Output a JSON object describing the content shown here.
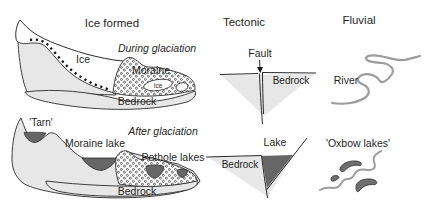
{
  "ice_formed": {
    "title": "Ice formed",
    "during": {
      "caption": "During glaciation",
      "ice": "Ice",
      "moraine": "Moraine",
      "bedrock": "Bedrock",
      "buried_ice": "Ice"
    },
    "after": {
      "caption": "After glaciation",
      "tarn": "'Tarn'",
      "moraine_lake": "Moraine lake",
      "pothole_lakes": "Pothole lakes",
      "bedrock": "Bedrock"
    }
  },
  "tectonic": {
    "title": "Tectonic",
    "during": {
      "fault": "Fault",
      "bedrock": "Bedrock"
    },
    "after": {
      "lake": "Lake",
      "bedrock": "Bedrock"
    }
  },
  "fluvial": {
    "title": "Fluvial",
    "during": {
      "river": "River"
    },
    "after": {
      "oxbow_lakes": "'Oxbow lakes'"
    }
  },
  "colors": {
    "land_gray": "#e7e7e7",
    "water_gray": "#666666",
    "oxbow_gray": "#6f6f6f",
    "river_gray": "#9c9c9c",
    "outline": "#2a2a2a",
    "text": "#1f1f1f"
  }
}
